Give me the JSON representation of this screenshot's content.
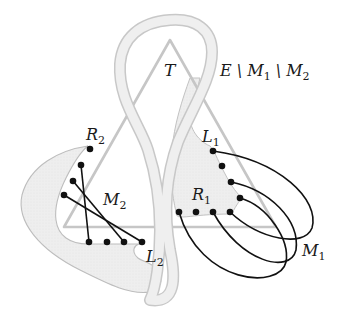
{
  "diagram": {
    "type": "graph-theory-figure",
    "colors": {
      "region_fill": "#ececec",
      "region_stroke": "#b8b8b8",
      "triangle_stroke": "#c4c4c4",
      "node": "#111111",
      "edge": "#111111",
      "label": "#1a1a1a"
    },
    "labels": {
      "T": "T",
      "E_minus": {
        "main": "E \\ M",
        "sub1": "1",
        "mid": " \\ M",
        "sub2": "2"
      },
      "R2": {
        "main": "R",
        "sub": "2"
      },
      "L1": {
        "main": "L",
        "sub": "1"
      },
      "M2": {
        "main": "M",
        "sub": "2"
      },
      "R1": {
        "main": "R",
        "sub": "1"
      },
      "L2": {
        "main": "L",
        "sub": "2"
      },
      "M1": {
        "main": "M",
        "sub": "1"
      }
    },
    "nodes": {
      "R2": [
        [
          90,
          149
        ],
        [
          81,
          165
        ],
        [
          73,
          181
        ],
        [
          64,
          195
        ]
      ],
      "L2": [
        [
          89,
          242
        ],
        [
          107,
          242
        ],
        [
          124,
          242
        ],
        [
          142,
          242
        ]
      ],
      "L1": [
        [
          213,
          151
        ],
        [
          222,
          166
        ],
        [
          231,
          182
        ],
        [
          240,
          198
        ]
      ],
      "R1": [
        [
          179,
          212
        ],
        [
          196,
          212
        ],
        [
          213,
          212
        ],
        [
          230,
          212
        ]
      ]
    },
    "edges": {
      "M2": [
        [
          "R2.1",
          "L2.0"
        ],
        [
          "R2.2",
          "L2.2"
        ],
        [
          "R2.3",
          "L2.3"
        ]
      ],
      "M1": [
        [
          "L1.0",
          "R1.3"
        ],
        [
          "L1.2",
          "R1.2"
        ],
        [
          "L1.3",
          "R1.0"
        ]
      ]
    }
  }
}
